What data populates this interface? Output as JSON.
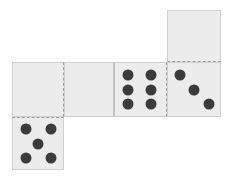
{
  "scene": {
    "title": "Domino chain layout",
    "background_color": "#ffffff",
    "tile_fill_color": "#ececec",
    "tile_border_color": "#d0d0d0",
    "divider_color": "#9a9a9a",
    "pip_color": "#3b3b3b",
    "pip_diameter": 11,
    "canvas": {
      "width": 233,
      "height": 182
    }
  },
  "cells": [
    {
      "id": "cell-top-right-blank",
      "name": "domino-cell-blank-top-right",
      "pip_count": 0,
      "orientation": "vertical",
      "x": 167,
      "y": 10,
      "width": 54,
      "height": 52,
      "dividers": [
        "bottom"
      ],
      "seams": [],
      "pips": []
    },
    {
      "id": "cell-row-1-blank",
      "name": "domino-cell-blank-left",
      "pip_count": 0,
      "orientation": "horizontal",
      "x": 12,
      "y": 62,
      "width": 52,
      "height": 55,
      "dividers": [
        "right"
      ],
      "seams": [],
      "pips": []
    },
    {
      "id": "cell-row-2-blank",
      "name": "domino-cell-blank-second",
      "pip_count": 0,
      "orientation": "horizontal",
      "x": 64,
      "y": 62,
      "width": 50,
      "height": 55,
      "dividers": [],
      "seams": [
        "right"
      ],
      "pips": []
    },
    {
      "id": "cell-row-3-six",
      "name": "domino-cell-six",
      "pip_count": 6,
      "orientation": "horizontal",
      "x": 114,
      "y": 62,
      "width": 53,
      "height": 55,
      "dividers": [
        "right"
      ],
      "seams": [
        "left"
      ],
      "pips": [
        {
          "cx": 25,
          "cy": 22
        },
        {
          "cx": 25,
          "cy": 50
        },
        {
          "cx": 25,
          "cy": 78
        },
        {
          "cx": 70,
          "cy": 22
        },
        {
          "cx": 70,
          "cy": 50
        },
        {
          "cx": 70,
          "cy": 78
        }
      ]
    },
    {
      "id": "cell-row-4-three",
      "name": "domino-cell-three",
      "pip_count": 3,
      "orientation": "horizontal",
      "x": 167,
      "y": 62,
      "width": 54,
      "height": 55,
      "dividers": [],
      "seams": [],
      "pips": [
        {
          "cx": 24,
          "cy": 22
        },
        {
          "cx": 50,
          "cy": 50
        },
        {
          "cx": 78,
          "cy": 78
        }
      ]
    },
    {
      "id": "cell-bottom-left-five",
      "name": "domino-cell-five",
      "pip_count": 5,
      "orientation": "vertical",
      "x": 12,
      "y": 117,
      "width": 52,
      "height": 53,
      "dividers": [
        "top"
      ],
      "seams": [],
      "pips": [
        {
          "cx": 25,
          "cy": 22
        },
        {
          "cx": 75,
          "cy": 22
        },
        {
          "cx": 50,
          "cy": 50
        },
        {
          "cx": 25,
          "cy": 78
        },
        {
          "cx": 75,
          "cy": 78
        }
      ]
    }
  ]
}
